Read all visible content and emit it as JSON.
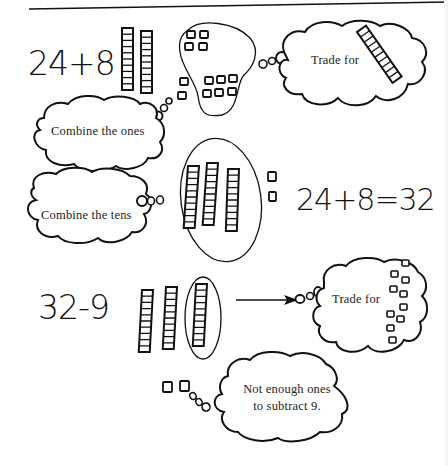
{
  "figure": {
    "sections": [
      {
        "id": "addition-combine-ones",
        "equation": "24+8",
        "blocks": {
          "tens_rods": 2,
          "ones_cubes_grouped": 4,
          "ones_cubes_added": 8
        },
        "thought_bubbles": [
          {
            "text": "Combine the ones"
          },
          {
            "text": "Trade for",
            "depicts": "1 ten-rod"
          }
        ]
      },
      {
        "id": "addition-combine-tens",
        "equation": "24+8=32",
        "blocks": {
          "tens_rods": 3,
          "ones_cubes": 2
        },
        "thought_bubbles": [
          {
            "text": "Combine the tens"
          }
        ]
      },
      {
        "id": "subtraction-trade",
        "equation": "32-9",
        "blocks": {
          "tens_rods": 3,
          "circled_rods": 1,
          "ones_cubes": 2
        },
        "thought_bubbles": [
          {
            "text": "Trade for",
            "depicts": "10 ones cubes"
          },
          {
            "text_line1": "Not enough ones",
            "text_line2": "to subtract 9."
          }
        ]
      }
    ]
  },
  "labels": {
    "eq1": "24+8",
    "eq2": "24+8=32",
    "eq3": "32-9",
    "combine_ones": "Combine the ones",
    "trade_for_1": "Trade for",
    "combine_tens": "Combine the tens",
    "trade_for_2": "Trade for",
    "not_enough_line1": "Not enough ones",
    "not_enough_line2": "to subtract 9."
  },
  "colors": {
    "ink": "#111111",
    "background": "#ffffff"
  }
}
